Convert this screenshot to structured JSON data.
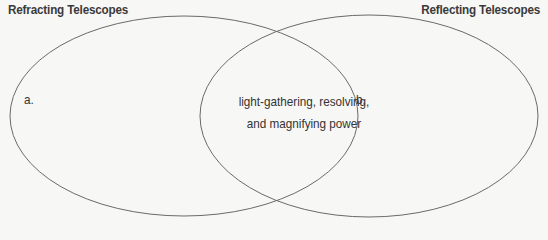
{
  "diagram": {
    "type": "venn",
    "sets": [
      {
        "name": "Refracting Telescopes",
        "title": "Refracting Telescopes",
        "region_label": "a."
      },
      {
        "name": "Reflecting Telescopes",
        "title": "Reflecting Telescopes",
        "region_label": "b."
      }
    ],
    "overlap": {
      "line1": "light-gathering, resolving,",
      "line2": "and magnifying power"
    },
    "colors": {
      "outline": "#6a6a6a",
      "background": "#f7f7f5",
      "text": "#333333"
    }
  }
}
